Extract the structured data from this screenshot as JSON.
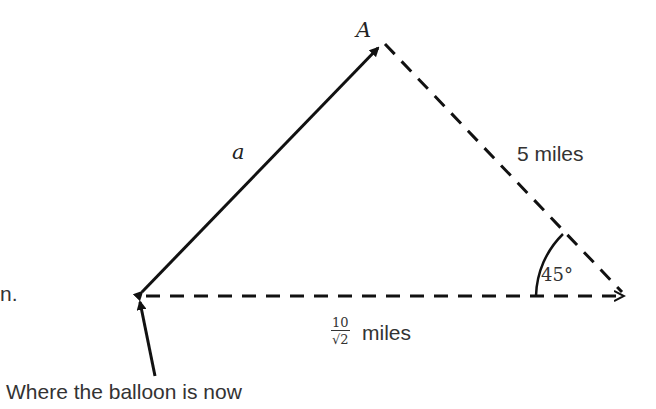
{
  "diagram": {
    "vertex_top_label": "A",
    "side_left_label": "a",
    "side_right_label": "5 miles",
    "angle_label": "45°",
    "base_fraction": {
      "numerator": "10",
      "denominator": "√2"
    },
    "base_unit": "miles",
    "edge_text_fragment": "n.",
    "pointer_caption": "Where the balloon is now",
    "colors": {
      "line": "#111111",
      "text": "#333333"
    }
  }
}
